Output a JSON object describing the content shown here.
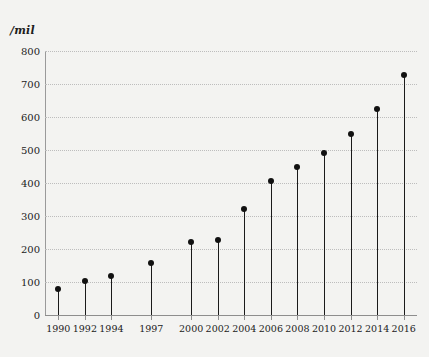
{
  "chart_data": {
    "type": "bar",
    "title": "",
    "subtitle": "",
    "xlabel": "",
    "ylabel": "/mil",
    "ylim": [
      0,
      800
    ],
    "xlim": [
      1989,
      2017
    ],
    "grid": true,
    "legend": "none",
    "marker_style": "filled-circle-stem",
    "categories": [
      "1990",
      "1992",
      "1994",
      "1997",
      "2000",
      "2002",
      "2004",
      "2006",
      "2008",
      "2010",
      "2012",
      "2014",
      "2016"
    ],
    "x": [
      1990,
      1992,
      1994,
      1997,
      2000,
      2002,
      2004,
      2006,
      2008,
      2010,
      2012,
      2014,
      2016
    ],
    "values": [
      78,
      102,
      117,
      158,
      220,
      227,
      322,
      405,
      448,
      490,
      548,
      623,
      726
    ],
    "ytick_labels": [
      "0",
      "100",
      "200",
      "300",
      "400",
      "500",
      "600",
      "700",
      "800"
    ],
    "yticks": [
      0,
      100,
      200,
      300,
      400,
      500,
      600,
      700,
      800
    ],
    "colors": {
      "background": "#f3f3f1",
      "marker": "#111111",
      "stem": "#1a1a1a",
      "grid": "#bdbdbd",
      "axis": "#8d8d8d",
      "text": "#222222"
    }
  }
}
